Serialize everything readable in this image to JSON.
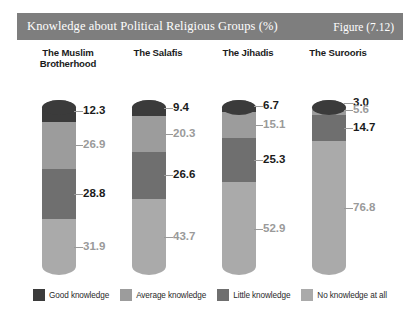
{
  "header": {
    "title": "Knowledge about Political Religious Groups (%)",
    "figure_number": "Figure (7.12)",
    "bar_color": "#7e7e7e"
  },
  "legend": {
    "items": [
      {
        "label": "Good knowledge",
        "color": "#3b3b3b"
      },
      {
        "label": "Average knowledge",
        "color": "#9c9c9c"
      },
      {
        "label": "Little knowledge",
        "color": "#6f6f6f"
      },
      {
        "label": "No knowledge at all",
        "color": "#aaaaaa"
      }
    ]
  },
  "chart_data": {
    "type": "bar",
    "title": "Knowledge about Political Religious Groups (%)",
    "subtitle": "Figure (7.12)",
    "xlabel": "",
    "ylabel": "",
    "ylim": [
      0,
      100
    ],
    "grid": false,
    "legend_position": "bottom",
    "stacked": true,
    "units": "percent",
    "categories": [
      "The Muslim Brotherhood",
      "The Salafis",
      "The Jihadis",
      "The Surooris"
    ],
    "series": [
      {
        "name": "Good knowledge",
        "color": "#3b3b3b",
        "values": [
          12.3,
          9.4,
          6.7,
          3.0
        ]
      },
      {
        "name": "Average knowledge",
        "color": "#9c9c9c",
        "values": [
          26.9,
          20.3,
          15.1,
          5.6
        ]
      },
      {
        "name": "Little knowledge",
        "color": "#6f6f6f",
        "values": [
          28.8,
          26.6,
          25.3,
          14.7
        ]
      },
      {
        "name": "No knowledge at all",
        "color": "#aaaaaa",
        "values": [
          31.9,
          43.7,
          52.9,
          76.8
        ]
      }
    ]
  },
  "groups": [
    {
      "label_line1": "The Muslim",
      "label_line2": "Brotherhood",
      "labels": [
        {
          "text": "12.3",
          "tone": "dark"
        },
        {
          "text": "26.9",
          "tone": "light"
        },
        {
          "text": "28.8",
          "tone": "dark"
        },
        {
          "text": "31.9",
          "tone": "light"
        }
      ]
    },
    {
      "label_line1": "The Salafis",
      "label_line2": "",
      "labels": [
        {
          "text": "9.4",
          "tone": "dark"
        },
        {
          "text": "20.3",
          "tone": "light"
        },
        {
          "text": "26.6",
          "tone": "dark"
        },
        {
          "text": "43.7",
          "tone": "light"
        }
      ]
    },
    {
      "label_line1": "The Jihadis",
      "label_line2": "",
      "labels": [
        {
          "text": "6.7",
          "tone": "dark"
        },
        {
          "text": "15.1",
          "tone": "light"
        },
        {
          "text": "25.3",
          "tone": "dark"
        },
        {
          "text": "52.9",
          "tone": "light"
        }
      ]
    },
    {
      "label_line1": "The Surooris",
      "label_line2": "",
      "labels": [
        {
          "text": "3.0",
          "tone": "dark"
        },
        {
          "text": "5.6",
          "tone": "light"
        },
        {
          "text": "14.7",
          "tone": "dark"
        },
        {
          "text": "76.8",
          "tone": "light"
        }
      ]
    }
  ]
}
